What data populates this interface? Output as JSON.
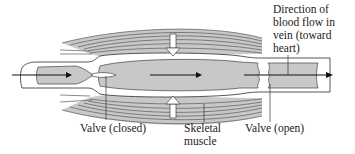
{
  "diagram": {
    "colors": {
      "background": "#ffffff",
      "vein_wall": "#ffffff",
      "vein_outline": "#444444",
      "blood": "#c8c8c8",
      "muscle_fibers": "#6a6a6a",
      "arrow": "#111111",
      "compression_arrow_fill": "#ffffff"
    },
    "labels": {
      "flow_direction": "Direction of\nblood flow in\nvein (toward\nheart)",
      "valve_closed": "Valve (closed)",
      "skeletal_muscle": "Skeletal\nmuscle",
      "valve_open": "Valve (open)"
    },
    "arrows": [
      {
        "name": "inflow-arrow",
        "direction": "right"
      },
      {
        "name": "flow-arrow-middle",
        "direction": "right"
      },
      {
        "name": "outflow-arrow",
        "direction": "right"
      },
      {
        "name": "muscle-compression-top",
        "direction": "down"
      },
      {
        "name": "muscle-compression-bottom",
        "direction": "up"
      }
    ]
  }
}
